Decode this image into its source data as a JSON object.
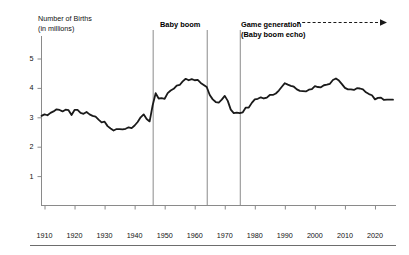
{
  "chart_data": {
    "type": "line",
    "title": "",
    "ylabel": "Number of Births",
    "ylabel_sub": "(in millions)",
    "xlabel": "",
    "ylim": [
      0,
      5.6
    ],
    "xlim": [
      1909,
      2027
    ],
    "grid": false,
    "legend": "none",
    "y_ticks": [
      "1",
      "2",
      "3",
      "4",
      "5"
    ],
    "y_tick_values": [
      1,
      2,
      3,
      4,
      5
    ],
    "x_ticks": [
      "1910",
      "1920",
      "1930",
      "1940",
      "1950",
      "1960",
      "1970",
      "1980",
      "1990",
      "2000",
      "2010",
      "2020"
    ],
    "x_tick_values": [
      1910,
      1920,
      1930,
      1940,
      1950,
      1960,
      1970,
      1980,
      1990,
      2000,
      2010,
      2020
    ],
    "series": [
      {
        "name": "Births",
        "x": [
          1909,
          1910,
          1911,
          1912,
          1913,
          1914,
          1915,
          1916,
          1917,
          1918,
          1919,
          1920,
          1921,
          1922,
          1923,
          1924,
          1925,
          1926,
          1927,
          1928,
          1929,
          1930,
          1931,
          1932,
          1933,
          1934,
          1935,
          1936,
          1937,
          1938,
          1939,
          1940,
          1941,
          1942,
          1943,
          1944,
          1945,
          1946,
          1947,
          1948,
          1949,
          1950,
          1951,
          1952,
          1953,
          1954,
          1955,
          1956,
          1957,
          1958,
          1959,
          1960,
          1961,
          1962,
          1963,
          1964,
          1965,
          1966,
          1967,
          1968,
          1969,
          1970,
          1971,
          1972,
          1973,
          1974,
          1975,
          1976,
          1977,
          1978,
          1979,
          1980,
          1981,
          1982,
          1983,
          1984,
          1985,
          1986,
          1987,
          1988,
          1989,
          1990,
          1991,
          1992,
          1993,
          1994,
          1995,
          1996,
          1997,
          1998,
          1999,
          2000,
          2001,
          2002,
          2003,
          2004,
          2005,
          2006,
          2007,
          2008,
          2009,
          2010,
          2011,
          2012,
          2013,
          2014,
          2015,
          2016,
          2017,
          2018,
          2019,
          2020,
          2021,
          2022,
          2023,
          2024,
          2025,
          2026
        ],
        "y": [
          3.05,
          3.1,
          3.07,
          3.15,
          3.2,
          3.27,
          3.25,
          3.2,
          3.26,
          3.24,
          3.08,
          3.25,
          3.25,
          3.15,
          3.12,
          3.18,
          3.1,
          3.05,
          3.02,
          2.92,
          2.83,
          2.85,
          2.7,
          2.62,
          2.55,
          2.6,
          2.6,
          2.59,
          2.61,
          2.66,
          2.63,
          2.72,
          2.84,
          3.0,
          3.1,
          2.94,
          2.86,
          3.41,
          3.82,
          3.64,
          3.65,
          3.63,
          3.82,
          3.91,
          3.97,
          4.08,
          4.1,
          4.22,
          4.31,
          4.26,
          4.3,
          4.26,
          4.27,
          4.17,
          4.1,
          4.03,
          3.76,
          3.61,
          3.52,
          3.5,
          3.6,
          3.73,
          3.56,
          3.26,
          3.14,
          3.16,
          3.14,
          3.17,
          3.33,
          3.33,
          3.49,
          3.61,
          3.63,
          3.68,
          3.64,
          3.67,
          3.76,
          3.76,
          3.81,
          3.91,
          4.04,
          4.16,
          4.11,
          4.07,
          4.04,
          3.95,
          3.9,
          3.89,
          3.88,
          3.94,
          3.96,
          4.06,
          4.03,
          4.02,
          4.09,
          4.11,
          4.14,
          4.27,
          4.32,
          4.25,
          4.13,
          4.0,
          3.95,
          3.95,
          3.93,
          3.99,
          3.98,
          3.95,
          3.85,
          3.79,
          3.75,
          3.61,
          3.66,
          3.67,
          3.59,
          3.6,
          3.6,
          3.6
        ],
        "start_value": 3.05,
        "end_value": 5.2,
        "peak_babyboom": {
          "year": 1957,
          "value": 4.31
        },
        "trough_depression": {
          "year": 1933,
          "value": 2.55
        }
      }
    ],
    "annotations": [
      {
        "name": "baby-boom",
        "label": "Baby boom",
        "start_year": 1946,
        "end_year": 1964,
        "type": "vertical-band-lines"
      },
      {
        "name": "game-generation",
        "label": "Game generation",
        "sublabel": "(Baby boom echo)",
        "start_year": 1975,
        "type": "vertical-line-with-dashed-arrow"
      }
    ]
  },
  "colors": {
    "line": "#1a1a1a",
    "axis": "#8a8a8a",
    "annotation_line": "#8a8a8a",
    "text": "#111111",
    "background": "#ffffff"
  }
}
